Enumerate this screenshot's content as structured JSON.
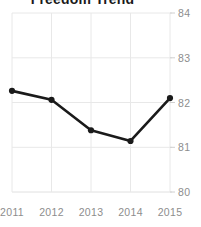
{
  "chart_data": {
    "type": "line",
    "title": "Freedom Trend",
    "xlabel": "",
    "ylabel": "",
    "categories": [
      "2011",
      "2012",
      "2013",
      "2014",
      "2015"
    ],
    "values": [
      82.26,
      82.06,
      81.38,
      81.14,
      82.1
    ],
    "series": [
      {
        "name": "Freedom Score",
        "values": [
          82.26,
          82.06,
          81.38,
          81.14,
          82.1
        ]
      }
    ],
    "x_tick_labels": [
      "2011",
      "2012",
      "2013",
      "2014",
      "2015"
    ],
    "y_tick_labels": [
      "80",
      "81",
      "82",
      "83",
      "84"
    ],
    "y_ticks": [
      80,
      81,
      82,
      83,
      84
    ],
    "ylim": [
      80,
      84
    ],
    "grid": true,
    "grid_color": "#e8e8e8",
    "legend": "none",
    "legend_position": "none",
    "line_color": "#1a1a1a",
    "marker_color": "#1a1a1a",
    "marker": "circle",
    "tick_label_color": "#8d8d8d",
    "title_color": "#1a1a1a",
    "background_color": "#ffffff",
    "y_axis_position": "right",
    "annotations": []
  }
}
